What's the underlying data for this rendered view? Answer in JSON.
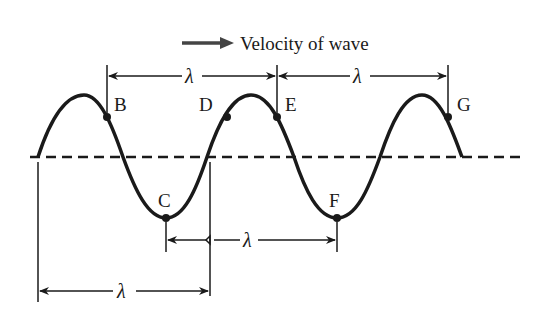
{
  "title": "Velocity of wave",
  "wavelength_symbol": "λ",
  "points": {
    "B": "B",
    "C": "C",
    "D": "D",
    "E": "E",
    "F": "F",
    "G": "G"
  },
  "dimensions": [
    {
      "from": "B",
      "to": "E",
      "label": "λ"
    },
    {
      "from": "E",
      "to": "G",
      "label": "λ"
    },
    {
      "from": "C",
      "to": "F",
      "label": "λ"
    },
    {
      "from": "start",
      "to": "crossing",
      "label": "λ"
    }
  ],
  "colors": {
    "ink": "#1a1a1a",
    "arrow": "#444444"
  }
}
